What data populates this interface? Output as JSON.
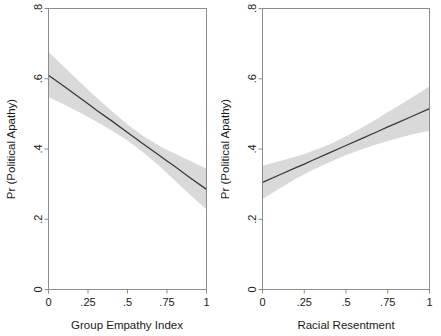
{
  "figure": {
    "background_color": "#ffffff",
    "panel_count": 2
  },
  "chart_data": [
    {
      "type": "line",
      "panel": "left",
      "title": "",
      "xlabel": "Group Empathy Index",
      "ylabel": "Pr (Political Apathy)",
      "xlim": [
        0,
        1
      ],
      "ylim": [
        0,
        0.8
      ],
      "xticks": [
        0,
        0.25,
        0.5,
        0.75,
        1
      ],
      "xticklabels": [
        "0",
        ".25",
        ".5",
        ".75",
        "1"
      ],
      "yticks": [
        0,
        0.2,
        0.4,
        0.6,
        0.8
      ],
      "yticklabels": [
        "0",
        ".2",
        ".4",
        ".6",
        ".8"
      ],
      "grid": false,
      "legend": false,
      "line_color": "#3a3a3a",
      "band_color": "#d9d9d9",
      "x": [
        0,
        0.1,
        0.2,
        0.25,
        0.3,
        0.4,
        0.5,
        0.6,
        0.7,
        0.75,
        0.8,
        0.9,
        1
      ],
      "series": [
        {
          "name": "Predicted Pr (Political Apathy)",
          "values": [
            0.61,
            0.578,
            0.545,
            0.529,
            0.512,
            0.48,
            0.447,
            0.414,
            0.382,
            0.366,
            0.35,
            0.317,
            0.285
          ]
        },
        {
          "name": "95% CI lower",
          "values": [
            0.548,
            0.527,
            0.503,
            0.491,
            0.479,
            0.453,
            0.424,
            0.39,
            0.352,
            0.331,
            0.31,
            0.268,
            0.228
          ]
        },
        {
          "name": "95% CI upper",
          "values": [
            0.676,
            0.633,
            0.59,
            0.569,
            0.548,
            0.508,
            0.47,
            0.437,
            0.409,
            0.397,
            0.387,
            0.365,
            0.344
          ]
        }
      ]
    },
    {
      "type": "line",
      "panel": "right",
      "title": "",
      "xlabel": "Racial Resentment",
      "ylabel": "Pr (Political Apathy)",
      "xlim": [
        0,
        1
      ],
      "ylim": [
        0,
        0.8
      ],
      "xticks": [
        0,
        0.25,
        0.5,
        0.75,
        1
      ],
      "xticklabels": [
        "0",
        ".25",
        ".5",
        ".75",
        "1"
      ],
      "yticks": [
        0,
        0.2,
        0.4,
        0.6,
        0.8
      ],
      "yticklabels": [
        "0",
        ".2",
        ".4",
        ".6",
        ".8"
      ],
      "grid": false,
      "legend": false,
      "line_color": "#3a3a3a",
      "band_color": "#d9d9d9",
      "x": [
        0,
        0.1,
        0.2,
        0.25,
        0.3,
        0.4,
        0.5,
        0.6,
        0.7,
        0.75,
        0.8,
        0.9,
        1
      ],
      "series": [
        {
          "name": "Predicted Pr (Political Apathy)",
          "values": [
            0.305,
            0.326,
            0.347,
            0.357,
            0.368,
            0.389,
            0.41,
            0.431,
            0.452,
            0.463,
            0.473,
            0.494,
            0.515
          ]
        },
        {
          "name": "95% CI lower",
          "values": [
            0.258,
            0.287,
            0.315,
            0.328,
            0.34,
            0.362,
            0.383,
            0.4,
            0.416,
            0.423,
            0.429,
            0.442,
            0.452
          ]
        },
        {
          "name": "95% CI upper",
          "values": [
            0.352,
            0.365,
            0.379,
            0.386,
            0.394,
            0.413,
            0.436,
            0.462,
            0.49,
            0.505,
            0.519,
            0.548,
            0.578
          ]
        }
      ]
    }
  ]
}
